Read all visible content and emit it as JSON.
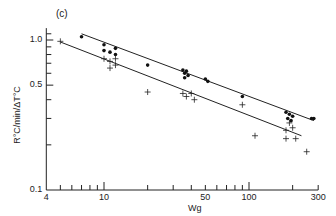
{
  "chart_data": {
    "type": "scatter",
    "panel_label": "(c)",
    "title": "",
    "xlabel": "Wg",
    "ylabel": "R°C/min/ΔT°C",
    "xscale": "log",
    "yscale": "log",
    "xlim": [
      4,
      300
    ],
    "ylim": [
      0.1,
      1.2
    ],
    "x_tick_labels": [
      "4",
      "10",
      "50",
      "100",
      "300"
    ],
    "y_tick_labels": [
      "0.1",
      "0.5",
      "1.0"
    ],
    "grid": false,
    "series": [
      {
        "name": "dots",
        "marker": "filled-circle",
        "points": [
          [
            7,
            1.05
          ],
          [
            10,
            0.93
          ],
          [
            10,
            0.85
          ],
          [
            11,
            0.83
          ],
          [
            12,
            0.88
          ],
          [
            12,
            0.8
          ],
          [
            20,
            0.68
          ],
          [
            35,
            0.63
          ],
          [
            36,
            0.6
          ],
          [
            37,
            0.62
          ],
          [
            38,
            0.58
          ],
          [
            36,
            0.56
          ],
          [
            50,
            0.55
          ],
          [
            52,
            0.53
          ],
          [
            90,
            0.42
          ],
          [
            180,
            0.33
          ],
          [
            190,
            0.32
          ],
          [
            200,
            0.31
          ],
          [
            185,
            0.3
          ],
          [
            195,
            0.29
          ],
          [
            270,
            0.3
          ],
          [
            280,
            0.3
          ]
        ]
      },
      {
        "name": "crosses",
        "marker": "plus",
        "points": [
          [
            5,
            0.98
          ],
          [
            10,
            0.75
          ],
          [
            11,
            0.72
          ],
          [
            12,
            0.75
          ],
          [
            11,
            0.65
          ],
          [
            12,
            0.68
          ],
          [
            20,
            0.45
          ],
          [
            35,
            0.44
          ],
          [
            37,
            0.42
          ],
          [
            40,
            0.44
          ],
          [
            42,
            0.4
          ],
          [
            90,
            0.37
          ],
          [
            110,
            0.23
          ],
          [
            180,
            0.25
          ],
          [
            190,
            0.28
          ],
          [
            200,
            0.26
          ],
          [
            210,
            0.22
          ],
          [
            180,
            0.22
          ],
          [
            250,
            0.18
          ]
        ]
      }
    ],
    "fit_lines": [
      {
        "name": "upper-fit",
        "from": [
          7,
          1.1
        ],
        "to": [
          280,
          0.29
        ]
      },
      {
        "name": "lower-fit",
        "from": [
          5,
          0.97
        ],
        "to": [
          230,
          0.23
        ]
      }
    ]
  }
}
